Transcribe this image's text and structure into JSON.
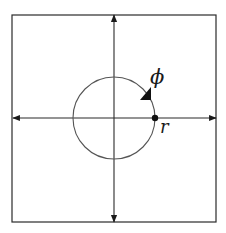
{
  "diagram": {
    "type": "polar-coordinate-diagram",
    "frame": {
      "x1": 12,
      "y1": 15,
      "x2": 216,
      "y2": 222,
      "stroke": "#2b2b2b"
    },
    "axes": {
      "origin": {
        "x": 114,
        "y": 118
      },
      "horizontal": {
        "x1": 13,
        "x2": 216,
        "y": 118,
        "arrows": "both"
      },
      "vertical": {
        "y1": 15,
        "y2": 222,
        "x": 114,
        "arrows": "both"
      },
      "stroke": "#2b2b2b"
    },
    "circle": {
      "cx": 114,
      "cy": 118,
      "r": 41,
      "stroke": "#555555"
    },
    "point": {
      "cx": 155,
      "cy": 118,
      "r": 3.2,
      "fill": "#111111"
    },
    "direction_arrow": {
      "points": "140,100 151,100 151,87",
      "fill": "#111111",
      "direction": "clockwise"
    },
    "labels": {
      "phi": {
        "text": "ϕ",
        "x": 150,
        "y": 84
      },
      "r": {
        "text": "r",
        "x": 160,
        "y": 133
      }
    }
  }
}
